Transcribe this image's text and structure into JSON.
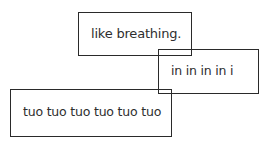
{
  "boxes": [
    {
      "text": "like breathing."
    },
    {
      "text": "in in in in i"
    },
    {
      "text": "tuo tuo tuo tuo tuo tuo"
    }
  ]
}
